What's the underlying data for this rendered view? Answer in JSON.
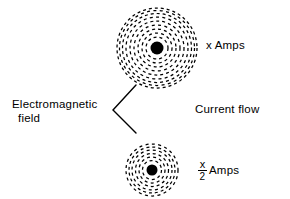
{
  "diagram": {
    "background_color": "#ffffff",
    "ink_color": "#000000",
    "labels": {
      "em_field_line1": "Electromagnetic",
      "em_field_line2": "field",
      "top_current": "x Amps",
      "current_flow": "Current flow",
      "bottom_current_numerator": "x",
      "bottom_current_denominator": "2",
      "bottom_current_unit": "Amps"
    },
    "fields": [
      {
        "name": "top-field",
        "center_x": 157,
        "center_y": 48,
        "conductor_radius": 6.5,
        "ring_count": 9,
        "ring_radii": [
          11,
          15,
          19,
          23,
          27,
          31,
          34.5,
          37.5,
          40
        ],
        "dash_pattern": "3 3",
        "current_label": "x Amps"
      },
      {
        "name": "bottom-field",
        "center_x": 152,
        "center_y": 170,
        "conductor_radius": 5.5,
        "ring_count": 6,
        "ring_radii": [
          9.5,
          13,
          16.5,
          20,
          23,
          26
        ],
        "dash_pattern": "3 3",
        "current_label": "x/2 Amps"
      }
    ],
    "leader": {
      "name": "em-field-leader-bracket",
      "vertex_x": 113,
      "vertex_y": 110,
      "upper_end_x": 136,
      "upper_end_y": 85,
      "lower_end_x": 136,
      "lower_end_y": 133,
      "stroke_width": 1.4
    }
  }
}
